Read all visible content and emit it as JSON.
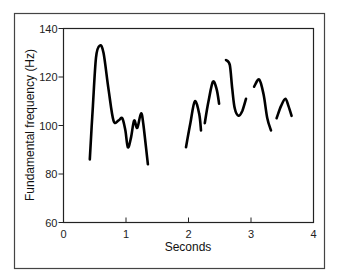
{
  "chart_data": {
    "type": "line",
    "title": "",
    "xlabel": "Seconds",
    "ylabel": "Fundamental frequency (Hz)",
    "xlim": [
      0,
      4
    ],
    "ylim": [
      60,
      140
    ],
    "xticks": [
      0,
      1,
      2,
      3,
      4
    ],
    "yticks": [
      60,
      80,
      100,
      120,
      140
    ],
    "grid": false,
    "legend": null,
    "series": [
      {
        "name": "F0 contour",
        "segments": [
          [
            [
              0.42,
              86
            ],
            [
              0.47,
              108
            ],
            [
              0.52,
              128
            ],
            [
              0.58,
              133
            ],
            [
              0.64,
              130
            ],
            [
              0.72,
              115
            ],
            [
              0.8,
              102
            ],
            [
              0.88,
              102
            ],
            [
              0.94,
              103
            ],
            [
              0.99,
              98
            ],
            [
              1.03,
              91
            ],
            [
              1.08,
              95
            ],
            [
              1.13,
              102
            ],
            [
              1.18,
              99
            ],
            [
              1.24,
              105
            ],
            [
              1.28,
              100
            ],
            [
              1.35,
              84
            ]
          ],
          [
            [
              1.96,
              91
            ],
            [
              2.03,
              101
            ],
            [
              2.1,
              110
            ],
            [
              2.17,
              105
            ],
            [
              2.2,
              98
            ]
          ],
          [
            [
              2.26,
              101
            ],
            [
              2.32,
              110
            ],
            [
              2.39,
              118
            ],
            [
              2.45,
              115
            ],
            [
              2.49,
              109
            ]
          ],
          [
            [
              2.6,
              127
            ],
            [
              2.66,
              125
            ],
            [
              2.7,
              115
            ],
            [
              2.74,
              107
            ],
            [
              2.8,
              104
            ],
            [
              2.86,
              106
            ],
            [
              2.92,
              111
            ]
          ],
          [
            [
              3.05,
              116
            ],
            [
              3.13,
              119
            ],
            [
              3.2,
              113
            ],
            [
              3.26,
              103
            ],
            [
              3.32,
              98
            ]
          ],
          [
            [
              3.41,
              103
            ],
            [
              3.48,
              108
            ],
            [
              3.55,
              111
            ],
            [
              3.6,
              108
            ],
            [
              3.65,
              104
            ]
          ]
        ]
      }
    ]
  },
  "labels": {
    "xlabel": "Seconds",
    "ylabel": "Fundamental frequency (Hz)",
    "xticks": [
      "0",
      "1",
      "2",
      "3",
      "4"
    ],
    "yticks": [
      "60",
      "80",
      "100",
      "120",
      "140"
    ]
  },
  "colors": {
    "line": "#000000",
    "axis": "#222222",
    "frame": "#444444"
  }
}
